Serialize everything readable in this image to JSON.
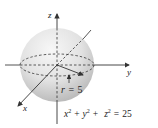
{
  "diagram": {
    "type": "sphere",
    "axes": {
      "x": "x",
      "y": "y",
      "z": "z"
    },
    "radius_label": {
      "var": "r",
      "eq": "=",
      "value": "5"
    },
    "equation": {
      "x": "x",
      "y": "y",
      "z": "z",
      "exp": "2",
      "plus": "+",
      "equals": "=",
      "rhs": "25"
    },
    "colors": {
      "line": "#333333",
      "sphere_light": "#f4f4f4",
      "sphere_dark": "#b8b8b8"
    }
  }
}
